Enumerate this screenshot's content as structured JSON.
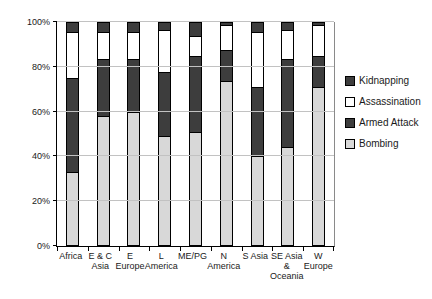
{
  "chart_data": {
    "type": "bar",
    "stacked": true,
    "units": "percent",
    "title": "",
    "categories": [
      "Africa",
      "E & C Asia",
      "E Europe",
      "L America",
      "ME/PG",
      "N America",
      "S Asia",
      "SE Asia & Oceania",
      "W Europe"
    ],
    "category_label_lines": [
      [
        "Africa"
      ],
      [
        "E & C",
        "Asia"
      ],
      [
        "E",
        "Europe"
      ],
      [
        "L",
        "America"
      ],
      [
        "ME/PG"
      ],
      [
        "N",
        "America"
      ],
      [
        "S Asia"
      ],
      [
        "SE Asia",
        "&",
        "Oceania"
      ],
      [
        "W",
        "Europe"
      ]
    ],
    "series": [
      {
        "name": "Bombing",
        "color": "#d8d8d8",
        "values": [
          33,
          58,
          60,
          49,
          51,
          74,
          40,
          44,
          71
        ]
      },
      {
        "name": "Armed Attack",
        "color": "#3d3d3d",
        "values": [
          42,
          26,
          24,
          29,
          34,
          14,
          31,
          40,
          14
        ]
      },
      {
        "name": "Assassination",
        "color": "#ffffff",
        "values": [
          21,
          12,
          12,
          19,
          9,
          11,
          25,
          13,
          14
        ]
      },
      {
        "name": "Kidnapping",
        "color": "#3d3d3d",
        "values": [
          4,
          4,
          4,
          3,
          6,
          1,
          4,
          3,
          1
        ]
      }
    ],
    "legend": [
      "Kidnapping",
      "Assassination",
      "Armed Attack",
      "Bombing"
    ],
    "legend_position": "right",
    "y_axis": {
      "ticks": [
        "0%",
        "20%",
        "40%",
        "60%",
        "80%",
        "100%"
      ],
      "tick_values": [
        0,
        20,
        40,
        60,
        80,
        100
      ],
      "min": 0,
      "max": 100,
      "gridlines": true
    }
  },
  "colors": {
    "background": "#ffffff",
    "axis": "#000000",
    "gridline": "#c2c2c2",
    "bar_border": "#000000",
    "text": "#1a1a1a"
  }
}
